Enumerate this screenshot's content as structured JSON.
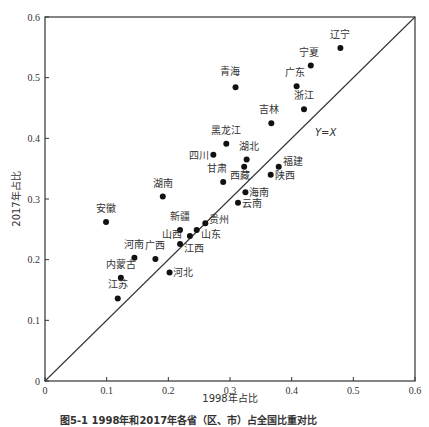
{
  "chart_data": {
    "type": "scatter",
    "title": "",
    "xlabel": "1998年占比",
    "ylabel": "2017年占比",
    "xlim": [
      0,
      0.6
    ],
    "ylim": [
      0,
      0.6
    ],
    "xticks": [
      "0",
      "0.1",
      "0.2",
      "0.3",
      "0.4",
      "0.5",
      "0.6"
    ],
    "yticks": [
      "0",
      "0.1",
      "0.2",
      "0.3",
      "0.4",
      "0.5",
      "0.6"
    ],
    "grid": false,
    "reference_line": {
      "label": "Y=X",
      "from": [
        0,
        0
      ],
      "to": [
        0.6,
        0.6
      ]
    },
    "points": [
      {
        "label": "辽宁",
        "x": 0.479,
        "y": 0.549,
        "lx": 0,
        "ly": -10,
        "anchor": "middle"
      },
      {
        "label": "宁夏",
        "x": 0.431,
        "y": 0.52,
        "lx": -2,
        "ly": -10,
        "anchor": "middle"
      },
      {
        "label": "广东",
        "x": 0.408,
        "y": 0.486,
        "lx": -2,
        "ly": -10,
        "anchor": "middle"
      },
      {
        "label": "青海",
        "x": 0.309,
        "y": 0.484,
        "lx": -6,
        "ly": -12,
        "anchor": "middle"
      },
      {
        "label": "浙江",
        "x": 0.42,
        "y": 0.448,
        "lx": 0,
        "ly": -10,
        "anchor": "middle"
      },
      {
        "label": "吉林",
        "x": 0.367,
        "y": 0.425,
        "lx": -2,
        "ly": -10,
        "anchor": "middle"
      },
      {
        "label": "黑龙江",
        "x": 0.294,
        "y": 0.391,
        "lx": 0,
        "ly": -10,
        "anchor": "middle"
      },
      {
        "label": "四川",
        "x": 0.273,
        "y": 0.373,
        "lx": -4,
        "ly": 4,
        "anchor": "end"
      },
      {
        "label": "湖北",
        "x": 0.327,
        "y": 0.365,
        "lx": 2,
        "ly": -10,
        "anchor": "middle"
      },
      {
        "label": "西藏",
        "x": 0.323,
        "y": 0.353,
        "lx": -4,
        "ly": 12,
        "anchor": "middle"
      },
      {
        "label": "福建",
        "x": 0.379,
        "y": 0.353,
        "lx": 4,
        "ly": -2,
        "anchor": "start"
      },
      {
        "label": "陕西",
        "x": 0.366,
        "y": 0.34,
        "lx": 4,
        "ly": 4,
        "anchor": "start"
      },
      {
        "label": "甘肃",
        "x": 0.289,
        "y": 0.328,
        "lx": -6,
        "ly": -10,
        "anchor": "middle"
      },
      {
        "label": "湖南",
        "x": 0.191,
        "y": 0.304,
        "lx": 0,
        "ly": -10,
        "anchor": "middle"
      },
      {
        "label": "海南",
        "x": 0.325,
        "y": 0.311,
        "lx": 4,
        "ly": 4,
        "anchor": "start"
      },
      {
        "label": "云南",
        "x": 0.313,
        "y": 0.294,
        "lx": 4,
        "ly": 4,
        "anchor": "start"
      },
      {
        "label": "安徽",
        "x": 0.099,
        "y": 0.262,
        "lx": 0,
        "ly": -10,
        "anchor": "middle"
      },
      {
        "label": "贵州",
        "x": 0.26,
        "y": 0.26,
        "lx": 4,
        "ly": 0,
        "anchor": "start"
      },
      {
        "label": "新疆",
        "x": 0.219,
        "y": 0.249,
        "lx": 0,
        "ly": -10,
        "anchor": "middle"
      },
      {
        "label": "山东",
        "x": 0.246,
        "y": 0.249,
        "lx": 4,
        "ly": 8,
        "anchor": "start"
      },
      {
        "label": "山西",
        "x": 0.235,
        "y": 0.239,
        "lx": -8,
        "ly": 2,
        "anchor": "end"
      },
      {
        "label": "江西",
        "x": 0.219,
        "y": 0.226,
        "lx": 4,
        "ly": 8,
        "anchor": "start"
      },
      {
        "label": "河南",
        "x": 0.145,
        "y": 0.203,
        "lx": 0,
        "ly": -10,
        "anchor": "middle"
      },
      {
        "label": "广西",
        "x": 0.179,
        "y": 0.201,
        "lx": 0,
        "ly": -10,
        "anchor": "middle"
      },
      {
        "label": "河北",
        "x": 0.202,
        "y": 0.179,
        "lx": 3,
        "ly": 4,
        "anchor": "start"
      },
      {
        "label": "内蒙古",
        "x": 0.123,
        "y": 0.17,
        "lx": 0,
        "ly": -10,
        "anchor": "middle"
      },
      {
        "label": "江苏",
        "x": 0.118,
        "y": 0.136,
        "lx": 0,
        "ly": -10,
        "anchor": "middle"
      }
    ]
  },
  "caption": "图5-1  1998年和2017年各省（区、市）占全国比重对比"
}
